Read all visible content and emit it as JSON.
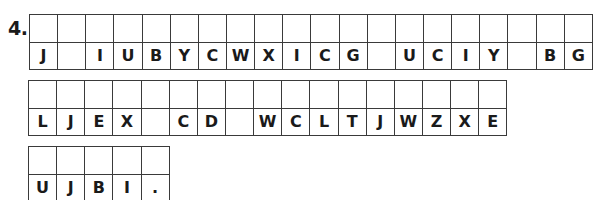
{
  "problem": {
    "number": "4.",
    "rows": [
      {
        "cells": [
          "J",
          "",
          "I",
          "U",
          "B",
          "Y",
          "C",
          "W",
          "X",
          "I",
          "C",
          "G",
          "",
          "U",
          "C",
          "I",
          "Y",
          "",
          "B",
          "G"
        ]
      },
      {
        "cells": [
          "L",
          "J",
          "E",
          "X",
          "",
          "C",
          "D",
          "",
          "W",
          "C",
          "L",
          "T",
          "J",
          "W",
          "Z",
          "X",
          "E"
        ]
      },
      {
        "cells": [
          "U",
          "J",
          "B",
          "I",
          "."
        ]
      }
    ]
  },
  "colors": {
    "grid_line": "#3a3a3a",
    "text": "#1a1a1a",
    "background": "#ffffff"
  }
}
